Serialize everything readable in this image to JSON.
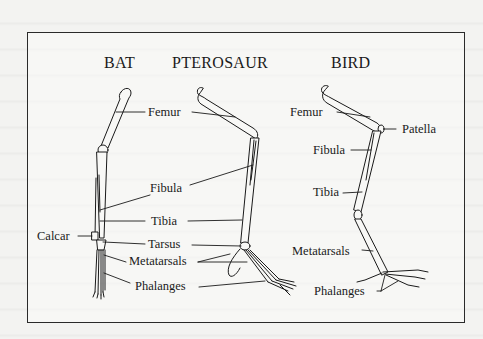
{
  "figure": {
    "columns": [
      {
        "id": "bat",
        "title": "BAT"
      },
      {
        "id": "pterosaur",
        "title": "PTEROSAUR"
      },
      {
        "id": "bird",
        "title": "BIRD"
      }
    ],
    "shared_labels": {
      "femur": "Femur",
      "fibula": "Fibula",
      "tibia": "Tibia",
      "calcar": "Calcar",
      "tarsus": "Tarsus",
      "metatarsals": "Metatarsals",
      "phalanges": "Phalanges"
    },
    "bird_labels": {
      "femur": "Femur",
      "patella": "Patella",
      "fibula": "Fibula",
      "tibia": "Tibia",
      "metatarsals": "Metatarsals",
      "phalanges": "Phalanges"
    },
    "colors": {
      "ink": "#1a1a1a",
      "paper": "#f3f3f1",
      "frame": "#2a2a2a"
    }
  }
}
